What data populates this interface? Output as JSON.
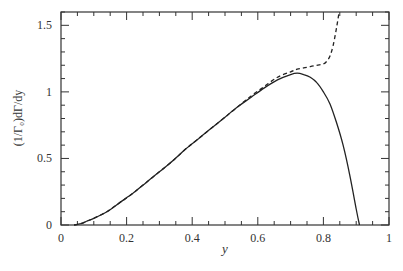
{
  "chart_data": {
    "type": "line",
    "title": "",
    "xlabel": "y",
    "ylabel": "(1/Γ₀)dΓ/dy",
    "xlim": [
      0,
      1
    ],
    "ylim": [
      0,
      1.6
    ],
    "x_ticks": [
      0,
      0.2,
      0.4,
      0.6,
      0.8,
      1
    ],
    "x_tick_labels": [
      "0",
      "0.2",
      "0.4",
      "0.6",
      "0.8",
      "1"
    ],
    "y_ticks": [
      0,
      0.5,
      1,
      1.5
    ],
    "y_tick_labels": [
      "0",
      "0.5",
      "1",
      "1.5"
    ],
    "x_minor_step": 0.05,
    "y_minor_step": 0.1,
    "grid": false,
    "legend": null,
    "series": [
      {
        "name": "solid",
        "style": "solid",
        "x": [
          0.04,
          0.06,
          0.08,
          0.1,
          0.14,
          0.18,
          0.22,
          0.26,
          0.3,
          0.34,
          0.38,
          0.42,
          0.46,
          0.5,
          0.54,
          0.58,
          0.62,
          0.66,
          0.7,
          0.72,
          0.74,
          0.76,
          0.78,
          0.8,
          0.82,
          0.84,
          0.86,
          0.88,
          0.9,
          0.91
        ],
        "y": [
          0.0,
          0.01,
          0.03,
          0.05,
          0.1,
          0.17,
          0.24,
          0.32,
          0.4,
          0.48,
          0.57,
          0.65,
          0.73,
          0.81,
          0.89,
          0.96,
          1.03,
          1.09,
          1.13,
          1.14,
          1.13,
          1.11,
          1.07,
          1.0,
          0.91,
          0.77,
          0.6,
          0.38,
          0.12,
          0.0
        ]
      },
      {
        "name": "dashed",
        "style": "dashed",
        "x": [
          0.04,
          0.06,
          0.08,
          0.1,
          0.14,
          0.18,
          0.22,
          0.26,
          0.3,
          0.34,
          0.38,
          0.42,
          0.46,
          0.5,
          0.54,
          0.58,
          0.62,
          0.66,
          0.7,
          0.72,
          0.74,
          0.76,
          0.78,
          0.8,
          0.81,
          0.82,
          0.83,
          0.84,
          0.848
        ],
        "y": [
          0.0,
          0.01,
          0.03,
          0.05,
          0.1,
          0.17,
          0.24,
          0.32,
          0.4,
          0.48,
          0.57,
          0.65,
          0.73,
          0.81,
          0.89,
          0.97,
          1.04,
          1.11,
          1.15,
          1.17,
          1.18,
          1.19,
          1.2,
          1.21,
          1.23,
          1.27,
          1.35,
          1.48,
          1.6
        ]
      }
    ]
  }
}
